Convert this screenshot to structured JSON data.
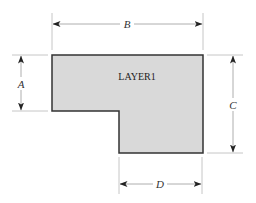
{
  "diagram": {
    "shape": {
      "label": "LAYER1",
      "fill": "#d9d9d9",
      "stroke": "#333333"
    },
    "dimensions": {
      "a": {
        "label": "A"
      },
      "b": {
        "label": "B"
      },
      "c": {
        "label": "C"
      },
      "d": {
        "label": "D"
      }
    }
  }
}
